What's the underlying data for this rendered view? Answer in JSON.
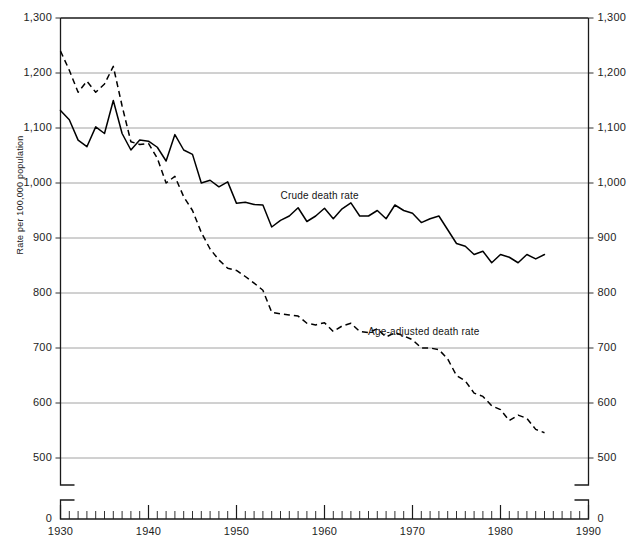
{
  "chart_data": {
    "type": "line",
    "title": "",
    "xlabel": "",
    "ylabel": "Rate per 100,000 population",
    "xlim": [
      1930,
      1990
    ],
    "ylim": [
      0,
      1300
    ],
    "y_axis_break": true,
    "y_break_note": "axis broken between 0 and 500",
    "grid": "horizontal",
    "legend_position": "inline-annotation",
    "yticks": [
      "0",
      "500",
      "600",
      "700",
      "800",
      "900",
      "1,000",
      "1,100",
      "1,200",
      "1,300"
    ],
    "ytick_values": [
      0,
      500,
      600,
      700,
      800,
      900,
      1000,
      1100,
      1200,
      1300
    ],
    "xticks": [
      "1930",
      "1940",
      "1950",
      "1960",
      "1970",
      "1980",
      "1990"
    ],
    "xtick_values": [
      1930,
      1940,
      1950,
      1960,
      1970,
      1980,
      1990
    ],
    "x_minor_tick_interval": 1,
    "x": [
      1930,
      1931,
      1932,
      1933,
      1934,
      1935,
      1936,
      1937,
      1938,
      1939,
      1940,
      1941,
      1942,
      1943,
      1944,
      1945,
      1946,
      1947,
      1948,
      1949,
      1950,
      1951,
      1952,
      1953,
      1954,
      1955,
      1956,
      1957,
      1958,
      1959,
      1960,
      1961,
      1962,
      1963,
      1964,
      1965,
      1966,
      1967,
      1968,
      1969,
      1970,
      1971,
      1972,
      1973,
      1974,
      1975,
      1976,
      1977,
      1978,
      1979,
      1980,
      1981,
      1982,
      1983,
      1984,
      1985
    ],
    "series": [
      {
        "name": "Crude death rate",
        "style": "solid",
        "label_x": 1960,
        "label_y": 975,
        "values": [
          1132,
          1115,
          1078,
          1066,
          1102,
          1090,
          1150,
          1090,
          1060,
          1078,
          1076,
          1065,
          1040,
          1088,
          1060,
          1052,
          1000,
          1005,
          993,
          1002,
          963,
          965,
          961,
          960,
          920,
          932,
          940,
          955,
          930,
          940,
          954,
          935,
          953,
          964,
          940,
          940,
          950,
          935,
          960,
          950,
          945,
          928,
          935,
          940,
          915,
          890,
          885,
          870,
          876,
          855,
          870,
          865,
          855,
          870,
          862,
          870
        ]
      },
      {
        "name": "Age-adjusted death rate",
        "style": "dashed",
        "label_x": 1972,
        "label_y": 728,
        "values": [
          1240,
          1205,
          1165,
          1185,
          1165,
          1180,
          1212,
          1140,
          1075,
          1070,
          1072,
          1045,
          1000,
          1012,
          975,
          950,
          910,
          880,
          860,
          845,
          841,
          830,
          818,
          805,
          765,
          762,
          760,
          758,
          745,
          742,
          746,
          730,
          740,
          745,
          730,
          728,
          735,
          720,
          728,
          722,
          715,
          700,
          700,
          697,
          680,
          650,
          640,
          618,
          612,
          595,
          588,
          568,
          578,
          572,
          552,
          546
        ]
      }
    ]
  },
  "axis": {
    "left_ticks": [
      "1,300",
      "1,200",
      "1,100",
      "1,000",
      "900",
      "800",
      "700",
      "600",
      "500",
      "0"
    ],
    "right_ticks": [
      "1,300",
      "1,200",
      "1,100",
      "1,000",
      "900",
      "800",
      "700",
      "600",
      "500",
      "0"
    ],
    "x_labels": [
      "1930",
      "1940",
      "1950",
      "1960",
      "1970",
      "1980",
      "1990"
    ]
  },
  "annotations": {
    "crude": "Crude death rate",
    "age_adjusted": "Age-adjusted death rate",
    "ylabel": "Rate per 100,000 population"
  }
}
